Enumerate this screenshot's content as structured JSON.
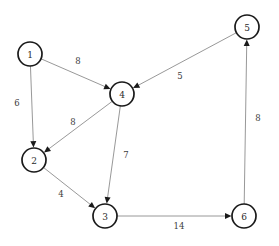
{
  "diagram": {
    "type": "directed-weighted-graph",
    "width": 279,
    "height": 246,
    "background_color": "#ffffff",
    "node_stroke_color": "#1a1a1a",
    "edge_color": "#8c8c8c",
    "arrowhead_color": "#1a1a1a",
    "label_color": "#2b2b2b",
    "node_radius": 12
  },
  "nodes": [
    {
      "id": "1",
      "label": "1",
      "x": 30,
      "y": 54
    },
    {
      "id": "2",
      "label": "2",
      "x": 34,
      "y": 160
    },
    {
      "id": "3",
      "label": "3",
      "x": 105,
      "y": 216
    },
    {
      "id": "4",
      "label": "4",
      "x": 122,
      "y": 94
    },
    {
      "id": "5",
      "label": "5",
      "x": 247,
      "y": 27
    },
    {
      "id": "6",
      "label": "6",
      "x": 244,
      "y": 216
    }
  ],
  "edges": [
    {
      "from": "1",
      "to": "4",
      "weight": "8",
      "label_x": 78,
      "label_y": 61
    },
    {
      "from": "1",
      "to": "2",
      "weight": "6",
      "label_x": 17,
      "label_y": 103
    },
    {
      "from": "4",
      "to": "2",
      "weight": "8",
      "label_x": 73,
      "label_y": 122
    },
    {
      "from": "4",
      "to": "3",
      "weight": "7",
      "label_x": 126,
      "label_y": 155
    },
    {
      "from": "2",
      "to": "3",
      "weight": "4",
      "label_x": 61,
      "label_y": 194
    },
    {
      "from": "3",
      "to": "6",
      "weight": "14",
      "label_x": 179,
      "label_y": 226
    },
    {
      "from": "6",
      "to": "5",
      "weight": "8",
      "label_x": 258,
      "label_y": 118
    },
    {
      "from": "5",
      "to": "4",
      "weight": "5",
      "label_x": 180,
      "label_y": 76
    }
  ]
}
